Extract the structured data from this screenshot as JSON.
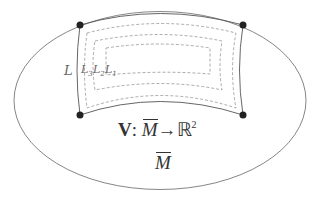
{
  "diagram": {
    "outer_region_label": "M",
    "outer_region_overbar": true,
    "map_formula": {
      "vector": "V",
      "colon": ":",
      "domain": "M",
      "arrow": "→",
      "codomain": "ℝ",
      "exponent": "2"
    },
    "curve_labels": [
      {
        "name": "L",
        "subscript": ""
      },
      {
        "name": "L",
        "subscript": "3"
      },
      {
        "name": "L",
        "subscript": "2"
      },
      {
        "name": "L",
        "subscript": "1"
      }
    ],
    "corner_points": 4,
    "nested_dashed_curves": 3,
    "colors": {
      "stroke": "#555555",
      "dashed": "#888888",
      "points": "#222222",
      "background": "#ffffff"
    }
  }
}
